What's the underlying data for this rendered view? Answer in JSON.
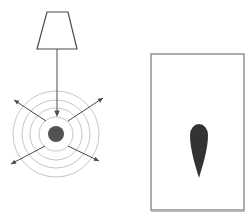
{
  "canvas": {
    "width": 249,
    "height": 222,
    "background": "#ffffff"
  },
  "colors": {
    "lamp_outline": "#4a4a4a",
    "beam_line": "#4f4f4f",
    "ring_stroke": "#c6c6c6",
    "source_dot_fill": "#525252",
    "radial_arrow": "#4a4a4a",
    "panel_border": "#929292",
    "panel_shadow": "#bdbdbd",
    "panel_fill": "#ffffff",
    "teardrop_fill": "#333333"
  },
  "diagram": {
    "lamp": {
      "shape": "trapezoid",
      "points": [
        [
          47,
          12
        ],
        [
          68,
          12
        ],
        [
          77,
          49
        ],
        [
          37,
          49
        ]
      ]
    },
    "beam_arrow": {
      "from": [
        57,
        49
      ],
      "to": [
        57,
        117
      ]
    },
    "wave_source": {
      "center": [
        56,
        134
      ],
      "dot_radius": 8,
      "ring_radii": [
        17,
        26,
        34,
        43
      ]
    },
    "radial_arrows": [
      {
        "from": [
          46,
          121
        ],
        "to": [
          14,
          100
        ]
      },
      {
        "from": [
          68,
          121
        ],
        "to": [
          103,
          98
        ]
      },
      {
        "from": [
          45,
          146
        ],
        "to": [
          11,
          164
        ]
      },
      {
        "from": [
          68,
          146
        ],
        "to": [
          99,
          161
        ]
      }
    ],
    "panel": {
      "x": 151,
      "y": 54,
      "width": 93,
      "height": 156
    },
    "teardrop": {
      "cx": 199,
      "top_y": 124,
      "tip_y": 178,
      "half_width": 9
    }
  }
}
